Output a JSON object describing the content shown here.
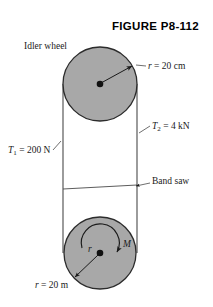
{
  "figure": {
    "title": "FIGURE P8-112",
    "background_color": "#ffffff",
    "ink_color": "#1a1a1a",
    "wheel_fill": "#a8a8a8",
    "wheel_stroke": "#2b2b2b"
  },
  "labels": {
    "idler_wheel": "Idler wheel",
    "radius_top_prefix": "r",
    "radius_top_value": " = 20 cm",
    "tension_left_symbol": "T",
    "tension_left_sub": "1",
    "tension_left_value": " = 200 N",
    "tension_right_symbol": "T",
    "tension_right_sub": "2",
    "tension_right_value": " = 4 kN",
    "band_saw": "Band saw",
    "moment": "M",
    "radius_inner": "r",
    "radius_bottom_prefix": "r",
    "radius_bottom_value": " = 20 m"
  },
  "geometry": {
    "upper_wheel": {
      "cx": 100,
      "cy": 84,
      "r": 37
    },
    "lower_wheel": {
      "cx": 100,
      "cy": 253,
      "r": 36
    },
    "belt_left_x": 63,
    "belt_right_x": 137,
    "band_saw_y_left": 188,
    "band_saw_y_right": 184
  }
}
